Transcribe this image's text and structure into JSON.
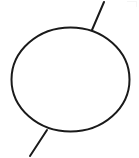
{
  "figure": {
    "title": "Ellipse with two tangential line segments",
    "background_color": "#ffffff",
    "stroke_color": "#1a1a1a",
    "stroke_width": 2,
    "canvas": {
      "width": 139,
      "height": 158
    },
    "shapes": [
      {
        "name": "ellipse",
        "type": "ellipse",
        "center_x": 70.5,
        "center_y": 79.5,
        "radius_x": 59,
        "radius_y": 52,
        "fill": "none",
        "stroke_color": "#1a1a1a",
        "stroke_width": 2
      },
      {
        "name": "upper-right-line",
        "type": "line",
        "x1": 92,
        "y1": 30,
        "x2": 104,
        "y2": 2,
        "stroke_color": "#1a1a1a",
        "stroke_width": 2
      },
      {
        "name": "lower-left-line",
        "type": "line",
        "x1": 47,
        "y1": 130,
        "x2": 30,
        "y2": 156,
        "stroke_color": "#1a1a1a",
        "stroke_width": 2
      }
    ]
  }
}
